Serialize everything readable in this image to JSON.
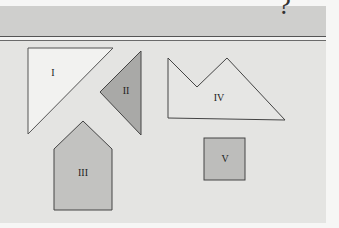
{
  "header": {
    "question_glyph": "?"
  },
  "figure": {
    "shapes": [
      {
        "id": "I",
        "label": "I",
        "kind": "right-triangle",
        "fill": "#f2f2f0",
        "stroke": "#555555"
      },
      {
        "id": "II",
        "label": "II",
        "kind": "triangle",
        "fill": "#a9a9a7",
        "stroke": "#444444"
      },
      {
        "id": "III",
        "label": "III",
        "kind": "pentagon",
        "fill": "#c2c2c0",
        "stroke": "#444444"
      },
      {
        "id": "IV",
        "label": "IV",
        "kind": "hexagon",
        "fill": "#e6e6e4",
        "stroke": "#444444"
      },
      {
        "id": "V",
        "label": "V",
        "kind": "square",
        "fill": "#bdbdbb",
        "stroke": "#444444"
      }
    ]
  },
  "colors": {
    "header_band": "#cfcfcd",
    "panel": "#e4e4e2",
    "rule": "#555555"
  }
}
